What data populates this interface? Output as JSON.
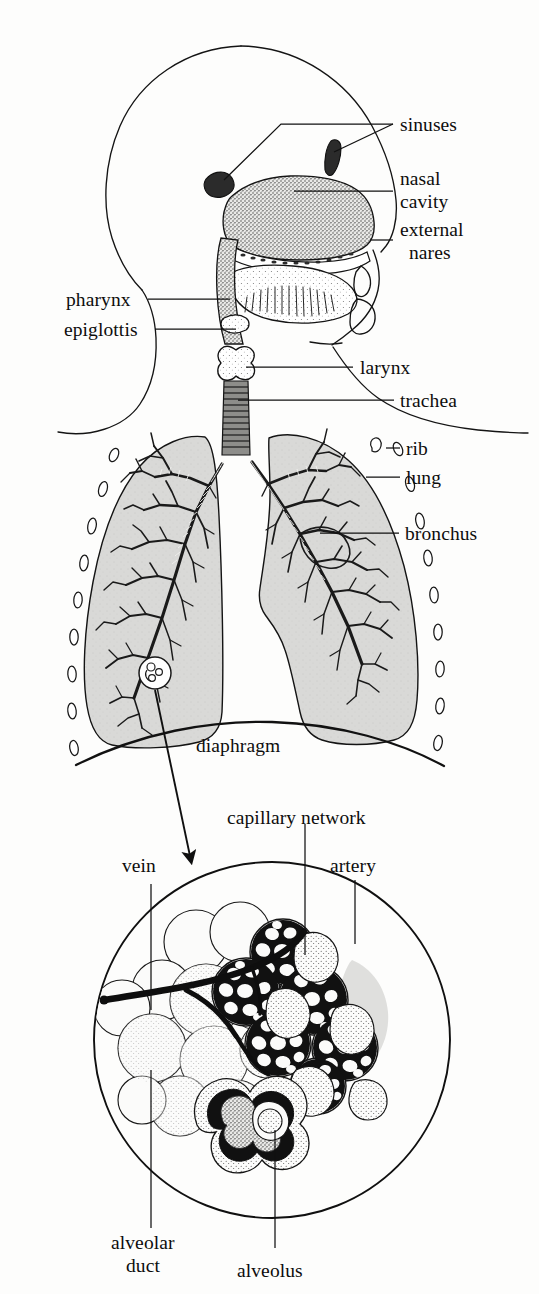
{
  "figure": {
    "style": "black and white line drawing with stippled shading"
  },
  "labels": {
    "sinuses": "sinuses",
    "nasal_cavity_line1": "nasal",
    "nasal_cavity_line2": "cavity",
    "external_nares_line1": "external",
    "external_nares_line2": "nares",
    "pharynx": "pharynx",
    "epiglottis": "epiglottis",
    "larynx": "larynx",
    "trachea": "trachea",
    "rib": "rib",
    "lung": "lung",
    "bronchus": "bronchus",
    "diaphragm": "diaphragm",
    "capillary_network": "capillary network",
    "vein": "vein",
    "artery": "artery",
    "alveolar_duct_line1": "alveolar",
    "alveolar_duct_line2": "duct",
    "alveolus": "alveolus"
  },
  "parts": [
    {
      "id": "sinuses",
      "label": "sinuses",
      "region": "head",
      "callout_side": "right"
    },
    {
      "id": "nasal-cavity",
      "label": "nasal cavity",
      "region": "head",
      "callout_side": "right"
    },
    {
      "id": "external-nares",
      "label": "external nares",
      "region": "head",
      "callout_side": "right"
    },
    {
      "id": "pharynx",
      "label": "pharynx",
      "region": "head",
      "callout_side": "left"
    },
    {
      "id": "epiglottis",
      "label": "epiglottis",
      "region": "head",
      "callout_side": "left"
    },
    {
      "id": "larynx",
      "label": "larynx",
      "region": "neck",
      "callout_side": "right"
    },
    {
      "id": "trachea",
      "label": "trachea",
      "region": "neck",
      "callout_side": "right"
    },
    {
      "id": "rib",
      "label": "rib",
      "region": "thorax",
      "callout_side": "right"
    },
    {
      "id": "lung",
      "label": "lung",
      "region": "thorax",
      "callout_side": "right"
    },
    {
      "id": "bronchus",
      "label": "bronchus",
      "region": "thorax",
      "callout_side": "right"
    },
    {
      "id": "diaphragm",
      "label": "diaphragm",
      "region": "thorax",
      "callout_side": "center"
    },
    {
      "id": "capillary-network",
      "label": "capillary network",
      "region": "alveoli-detail",
      "callout_side": "top"
    },
    {
      "id": "vein",
      "label": "vein",
      "region": "alveoli-detail",
      "callout_side": "top-left"
    },
    {
      "id": "artery",
      "label": "artery",
      "region": "alveoli-detail",
      "callout_side": "top-right"
    },
    {
      "id": "alveolar-duct",
      "label": "alveolar duct",
      "region": "alveoli-detail",
      "callout_side": "bottom-left"
    },
    {
      "id": "alveolus",
      "label": "alveolus",
      "region": "alveoli-detail",
      "callout_side": "bottom"
    }
  ],
  "colors": {
    "ink": "#111111",
    "organ_gray": "#d8d8d6",
    "airway_gray": "#8d8d8a",
    "sinus_dark": "#2b2b2b",
    "capillary_dark": "#111111",
    "background": "#fdfdfc"
  },
  "panels": [
    {
      "id": "head-neck-panel",
      "description": "lateral view of head and neck showing upper airway"
    },
    {
      "id": "thorax-panel",
      "description": "anterior view of lungs, bronchial tree, ribs and diaphragm"
    },
    {
      "id": "alveoli-detail-panel",
      "description": "circular magnified inset of alveolar cluster with capillary network"
    }
  ]
}
